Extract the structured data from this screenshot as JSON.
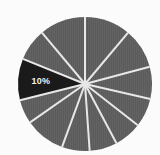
{
  "chart_data": {
    "type": "pie",
    "title": "",
    "subtitle": "",
    "xlabel": "",
    "ylabel": "",
    "legend": "none",
    "grid": false,
    "center": {
      "cx": 85,
      "cy": 84
    },
    "radius": 67,
    "start_angle_deg": 0,
    "direction": "clockwise",
    "divider_color": "#e8e8e8",
    "divider_width": 2.0,
    "background_color": "#fbfbfb",
    "default_slice_color": "#5b5b5b",
    "highlight_slice_color": "#1a1a1a",
    "label_color": "#f2f2f2",
    "labels": [
      "10%"
    ],
    "categories": [
      "Slice 1",
      "Slice 2",
      "Slice 3",
      "Slice 4",
      "Slice 5",
      "Slice 6",
      "Slice 7",
      "Slice 8",
      "Slice 9",
      "Slice 10",
      "Slice 11",
      "Slice 12"
    ],
    "values": [
      11,
      10,
      8,
      7,
      7,
      7,
      7,
      10,
      6,
      9,
      8,
      10
    ],
    "slices": [
      {
        "name": "Slice 1",
        "value": 11,
        "start_deg": 0,
        "end_deg": 40,
        "color": "#5b5b5b",
        "highlighted": false,
        "label": ""
      },
      {
        "name": "Slice 2",
        "value": 10,
        "start_deg": 40,
        "end_deg": 75,
        "color": "#5b5b5b",
        "highlighted": false,
        "label": ""
      },
      {
        "name": "Slice 3",
        "value": 8,
        "start_deg": 75,
        "end_deg": 103,
        "color": "#5b5b5b",
        "highlighted": false,
        "label": ""
      },
      {
        "name": "Slice 4",
        "value": 7,
        "start_deg": 103,
        "end_deg": 128,
        "color": "#5b5b5b",
        "highlighted": false,
        "label": ""
      },
      {
        "name": "Slice 5",
        "value": 7,
        "start_deg": 128,
        "end_deg": 152,
        "color": "#5b5b5b",
        "highlighted": false,
        "label": ""
      },
      {
        "name": "Slice 6",
        "value": 7,
        "start_deg": 152,
        "end_deg": 176,
        "color": "#5b5b5b",
        "highlighted": false,
        "label": ""
      },
      {
        "name": "Slice 7",
        "value": 7,
        "start_deg": 176,
        "end_deg": 200,
        "color": "#5b5b5b",
        "highlighted": false,
        "label": ""
      },
      {
        "name": "Slice 8",
        "value": 10,
        "start_deg": 200,
        "end_deg": 235,
        "color": "#5b5b5b",
        "highlighted": false,
        "label": ""
      },
      {
        "name": "Slice 9",
        "value": 6,
        "start_deg": 235,
        "end_deg": 256,
        "color": "#5b5b5b",
        "highlighted": false,
        "label": ""
      },
      {
        "name": "Slice 10",
        "value": 10,
        "start_deg": 256,
        "end_deg": 292,
        "color": "#1a1a1a",
        "highlighted": true,
        "label": "10%"
      },
      {
        "name": "Slice 11",
        "value": 8,
        "start_deg": 292,
        "end_deg": 320,
        "color": "#5b5b5b",
        "highlighted": false,
        "label": ""
      },
      {
        "name": "Slice 12",
        "value": 10,
        "start_deg": 320,
        "end_deg": 360,
        "color": "#5b5b5b",
        "highlighted": false,
        "label": ""
      }
    ]
  }
}
